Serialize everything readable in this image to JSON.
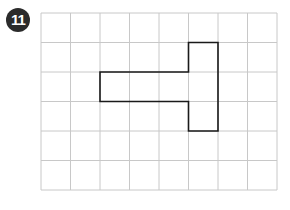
{
  "problem": {
    "number": "11"
  },
  "grid": {
    "columns": 8,
    "rows": 6,
    "origin_x": 41,
    "origin_y": 13,
    "cell_size": 29.5,
    "line_color": "#c8c8c8"
  },
  "shape": {
    "description": "T-shaped polygon (rotated) drawn on grid",
    "stroke_color": "#1a1a1a",
    "vertices_grid": [
      [
        5,
        1
      ],
      [
        6,
        1
      ],
      [
        6,
        4
      ],
      [
        5,
        4
      ],
      [
        5,
        3
      ],
      [
        2,
        3
      ],
      [
        2,
        2
      ],
      [
        5,
        2
      ]
    ]
  }
}
